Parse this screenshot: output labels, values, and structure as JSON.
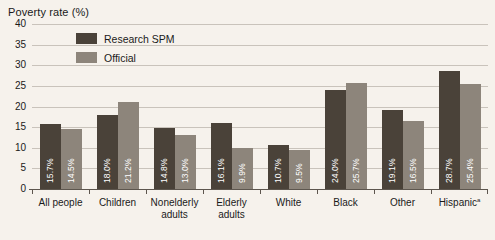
{
  "chart_data": {
    "type": "bar",
    "title": "Poverty rate (%)",
    "xlabel": "",
    "ylabel": "Poverty rate (%)",
    "ylim": [
      0,
      40
    ],
    "yticks": [
      0,
      5,
      10,
      15,
      20,
      25,
      30,
      35,
      40
    ],
    "grid": true,
    "legend_position": "upper-left-inside",
    "categories": [
      "All people",
      "Children",
      "Nonelderly adults",
      "Elderly adults",
      "White",
      "Black",
      "Other",
      "Hispanic"
    ],
    "category_footnotes": {
      "Hispanic": "a"
    },
    "series": [
      {
        "name": "Research SPM",
        "color": "#4a4239",
        "values": [
          15.7,
          18.0,
          14.8,
          16.1,
          10.7,
          24.0,
          19.1,
          28.7
        ],
        "labels": [
          "15.7%",
          "18.0%",
          "14.8%",
          "16.1%",
          "10.7%",
          "24.0%",
          "19.1%",
          "28.7%"
        ]
      },
      {
        "name": "Official",
        "color": "#8d857b",
        "values": [
          14.5,
          21.2,
          13.0,
          9.9,
          9.5,
          25.7,
          16.5,
          25.4
        ],
        "labels": [
          "14.5%",
          "21.2%",
          "13.0%",
          "9.9%",
          "9.5%",
          "25.7%",
          "16.5%",
          "25.4%"
        ]
      }
    ]
  },
  "legend": {
    "items": [
      {
        "label": "Research SPM",
        "swatch": "#4a4239"
      },
      {
        "label": "Official",
        "swatch": "#8d857b"
      }
    ]
  },
  "axis": {
    "y_tick_labels": [
      "40",
      "35",
      "30",
      "25",
      "20",
      "15",
      "10",
      "5",
      "0"
    ],
    "x_tick_labels": [
      {
        "line1": "All people",
        "line2": "",
        "footnote": ""
      },
      {
        "line1": "Children",
        "line2": "",
        "footnote": ""
      },
      {
        "line1": "Nonelderly",
        "line2": "adults",
        "footnote": ""
      },
      {
        "line1": "Elderly",
        "line2": "adults",
        "footnote": ""
      },
      {
        "line1": "White",
        "line2": "",
        "footnote": ""
      },
      {
        "line1": "Black",
        "line2": "",
        "footnote": ""
      },
      {
        "line1": "Other",
        "line2": "",
        "footnote": ""
      },
      {
        "line1": "Hispanic",
        "line2": "",
        "footnote": "a"
      }
    ]
  },
  "colors": {
    "background": "#f6f2ec",
    "gridline": "#c9c3bb",
    "axis": "#5d564e",
    "research_spm": "#4a4239",
    "official": "#8d857b",
    "text": "#1a1a1a",
    "value_label": "#ffffff"
  }
}
